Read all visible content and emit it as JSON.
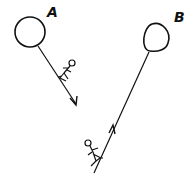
{
  "diagram": {
    "balloons": [
      {
        "label": "A",
        "rope_arrow_direction": "down",
        "figure_position": "on rope below balloon"
      },
      {
        "label": "B",
        "rope_arrow_direction": "up",
        "figure_position": "at bottom of rope"
      }
    ],
    "colors": {
      "ink": "#111111",
      "background": "#ffffff"
    }
  }
}
